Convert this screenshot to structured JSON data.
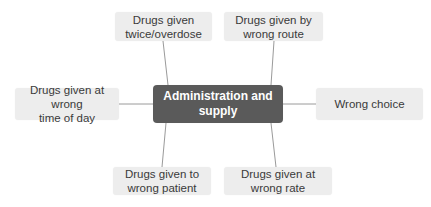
{
  "diagram": {
    "type": "mind-map",
    "center": {
      "label": "Administration and supply",
      "line1": "Administration and",
      "line2": "supply"
    },
    "branches": [
      {
        "id": "twice-overdose",
        "line1": "Drugs given",
        "line2": "twice/overdose",
        "position": "top-left"
      },
      {
        "id": "wrong-route",
        "line1": "Drugs given by",
        "line2": "wrong route",
        "position": "top-right"
      },
      {
        "id": "wrong-time",
        "line1": "Drugs given at wrong",
        "line2": "time of day",
        "position": "left"
      },
      {
        "id": "wrong-choice",
        "line1": "Wrong choice",
        "line2": "",
        "position": "right"
      },
      {
        "id": "wrong-patient",
        "line1": "Drugs given to",
        "line2": "wrong patient",
        "position": "bottom-left"
      },
      {
        "id": "wrong-rate",
        "line1": "Drugs given at",
        "line2": "wrong rate",
        "position": "bottom-right"
      }
    ],
    "colors": {
      "center_fill": "#5a5a5a",
      "center_text": "#ffffff",
      "branch_fill": "#ededed",
      "branch_text": "#3a3a3a",
      "connector": "#9a9a9a"
    }
  }
}
